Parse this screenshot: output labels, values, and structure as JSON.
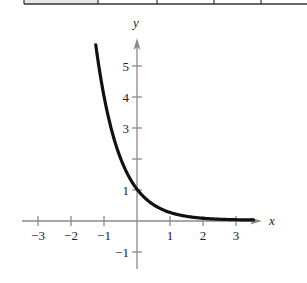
{
  "table_fragment": {
    "cell_dividers_px": [
      24,
      98,
      157,
      214,
      261,
      307
    ],
    "header_cell_fill": "#e6e6e6",
    "border_color": "#333333"
  },
  "colors": {
    "axis": "#8a8a8a",
    "curve": "#111111",
    "text": "#222222"
  },
  "chart_data": {
    "type": "line",
    "title": "",
    "function": "y = 4^(-x)",
    "xlabel": "x",
    "ylabel": "y",
    "xlim": [
      -3.2,
      3.8
    ],
    "ylim": [
      -1.5,
      5.8
    ],
    "grid": false,
    "legend": null,
    "x_ticks": [
      -3,
      -2,
      -1,
      1,
      2,
      3
    ],
    "x_tick_labels": [
      "−3",
      "−2",
      "−1",
      "1",
      "2",
      "3"
    ],
    "y_ticks": [
      -1,
      1,
      2,
      3,
      4,
      5
    ],
    "y_tick_labels": [
      "−1",
      "1",
      "",
      "3",
      "4",
      "5"
    ],
    "series": [
      {
        "name": "y = 4^(-x)",
        "x": [
          -1.25,
          -1,
          -0.75,
          -0.5,
          -0.25,
          0,
          0.25,
          0.5,
          0.75,
          1,
          1.5,
          2,
          2.5,
          3,
          3.5
        ],
        "y": [
          5.66,
          4.0,
          2.83,
          2.0,
          1.41,
          1.0,
          0.71,
          0.5,
          0.35,
          0.25,
          0.125,
          0.0625,
          0.031,
          0.016,
          0.008
        ]
      }
    ]
  }
}
